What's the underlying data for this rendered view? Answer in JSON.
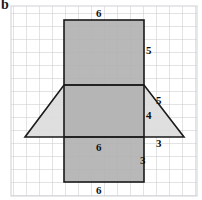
{
  "figure": {
    "part_label": "b",
    "grid": {
      "cell_size": 13,
      "left": 11,
      "top": 6,
      "right": 197,
      "bottom": 196,
      "cols": 14,
      "rows": 14,
      "line_color": "#c8c8cc",
      "border_color": "#d8d8dc"
    },
    "colors": {
      "rect_fill": "#b3b3b3",
      "trapezoid_fill": "#d9d9d9",
      "overlap_fill": "#a8a8a8",
      "outline": "#1a1a1a",
      "background": "#ffffff"
    },
    "shapes": {
      "top_rectangle": {
        "name": "top-rectangle",
        "x": 64,
        "y": 20,
        "width": 80,
        "height": 65,
        "units_width": 6,
        "units_height": 5
      },
      "middle_rectangle": {
        "name": "middle-rectangle",
        "x": 64,
        "y": 85,
        "width": 80,
        "height": 52,
        "units_width": 6,
        "units_height": 4
      },
      "bottom_rectangle": {
        "name": "bottom-rectangle",
        "x": 64,
        "y": 137,
        "width": 80,
        "height": 45,
        "units_width": 6,
        "units_height": 3
      },
      "trapezoid": {
        "name": "trapezoid",
        "points": "64,85 144,85 184,137 25,137",
        "top_width_units": 6,
        "left_slant_units": 5,
        "right_slant_units": 5
      }
    },
    "dimension_labels": [
      {
        "id": "top-width",
        "text": "6",
        "x": 100,
        "y": 8,
        "edge": "top edge of top rectangle"
      },
      {
        "id": "top-right-height",
        "text": "5",
        "x": 146,
        "y": 46,
        "edge": "right edge of top rectangle"
      },
      {
        "id": "slant-right",
        "text": "5",
        "x": 157,
        "y": 99,
        "edge": "right slant side of trapezoid"
      },
      {
        "id": "mid-right-height",
        "text": "4",
        "x": 146,
        "y": 112,
        "edge": "right edge of middle rectangle"
      },
      {
        "id": "base-run",
        "text": "3",
        "x": 157,
        "y": 139,
        "edge": "horizontal run of right triangle"
      },
      {
        "id": "lower-width",
        "text": "6",
        "x": 100,
        "y": 143,
        "edge": "width of lower rectangle"
      },
      {
        "id": "lower-height",
        "text": "3",
        "x": 146,
        "y": 156,
        "edge": "right edge of lower rectangle"
      },
      {
        "id": "bottom-width",
        "text": "6",
        "x": 100,
        "y": 186,
        "edge": "bottom edge of lower rectangle"
      }
    ]
  }
}
